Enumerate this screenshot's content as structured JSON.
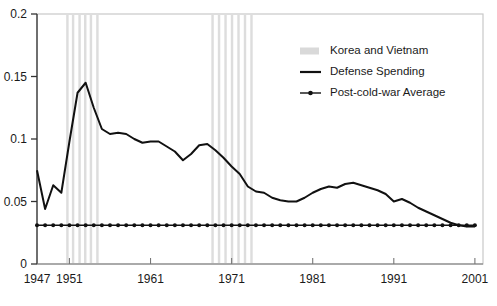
{
  "chart_data": {
    "type": "line",
    "title": "",
    "xlabel": "",
    "ylabel": "",
    "xlim": [
      1947,
      2002
    ],
    "ylim": [
      0,
      0.2
    ],
    "grid": false,
    "legend_position": "top-right",
    "xticks": [
      1947,
      1951,
      1961,
      1971,
      1981,
      1991,
      2001
    ],
    "xtick_labels": [
      "1947",
      "1951",
      "1961",
      "1971",
      "1981",
      "1991",
      "2001"
    ],
    "yticks": [
      0,
      0.05,
      0.1,
      0.15,
      0.2
    ],
    "ytick_labels": [
      "0",
      "0.05",
      "0.1",
      "0.15",
      "0.2"
    ],
    "legend": [
      {
        "label": "Korea and Vietnam",
        "marker": "band",
        "color": "#d9d9d9"
      },
      {
        "label": "Defense Spending",
        "marker": "line",
        "color": "#111111"
      },
      {
        "label": "Post-cold-war Average",
        "marker": "line-dot",
        "color": "#111111"
      }
    ],
    "series": [
      {
        "name": "Defense Spending",
        "color": "#111111",
        "x": [
          1947,
          1948,
          1949,
          1950,
          1951,
          1952,
          1953,
          1954,
          1955,
          1956,
          1957,
          1958,
          1959,
          1960,
          1961,
          1962,
          1963,
          1964,
          1965,
          1966,
          1967,
          1968,
          1969,
          1970,
          1971,
          1972,
          1973,
          1974,
          1975,
          1976,
          1977,
          1978,
          1979,
          1980,
          1981,
          1982,
          1983,
          1984,
          1985,
          1986,
          1987,
          1988,
          1989,
          1990,
          1991,
          1992,
          1993,
          1994,
          1995,
          1996,
          1997,
          1998,
          1999,
          2000,
          2001
        ],
        "values": [
          0.075,
          0.044,
          0.063,
          0.057,
          0.098,
          0.137,
          0.145,
          0.125,
          0.108,
          0.104,
          0.105,
          0.104,
          0.1,
          0.097,
          0.098,
          0.098,
          0.094,
          0.09,
          0.083,
          0.088,
          0.095,
          0.096,
          0.091,
          0.085,
          0.078,
          0.072,
          0.062,
          0.058,
          0.057,
          0.053,
          0.051,
          0.05,
          0.05,
          0.053,
          0.057,
          0.06,
          0.062,
          0.061,
          0.064,
          0.065,
          0.063,
          0.061,
          0.059,
          0.056,
          0.05,
          0.052,
          0.049,
          0.045,
          0.042,
          0.039,
          0.036,
          0.033,
          0.031,
          0.03,
          0.03
        ]
      },
      {
        "name": "Post-cold-war Average",
        "color": "#111111",
        "marker": "dot",
        "x": [
          1947,
          1948,
          1949,
          1950,
          1951,
          1952,
          1953,
          1954,
          1955,
          1956,
          1957,
          1958,
          1959,
          1960,
          1961,
          1962,
          1963,
          1964,
          1965,
          1966,
          1967,
          1968,
          1969,
          1970,
          1971,
          1972,
          1973,
          1974,
          1975,
          1976,
          1977,
          1978,
          1979,
          1980,
          1981,
          1982,
          1983,
          1984,
          1985,
          1986,
          1987,
          1988,
          1989,
          1990,
          1991,
          1992,
          1993,
          1994,
          1995,
          1996,
          1997,
          1998,
          1999,
          2000,
          2001
        ],
        "values": [
          0.031,
          0.031,
          0.031,
          0.031,
          0.031,
          0.031,
          0.031,
          0.031,
          0.031,
          0.031,
          0.031,
          0.031,
          0.031,
          0.031,
          0.031,
          0.031,
          0.031,
          0.031,
          0.031,
          0.031,
          0.031,
          0.031,
          0.031,
          0.031,
          0.031,
          0.031,
          0.031,
          0.031,
          0.031,
          0.031,
          0.031,
          0.031,
          0.031,
          0.031,
          0.031,
          0.031,
          0.031,
          0.031,
          0.031,
          0.031,
          0.031,
          0.031,
          0.031,
          0.031,
          0.031,
          0.031,
          0.031,
          0.031,
          0.031,
          0.031,
          0.031,
          0.031,
          0.031,
          0.031,
          0.031
        ]
      }
    ],
    "bands": {
      "name": "Korea and Vietnam",
      "color": "#dddddd",
      "stripes": [
        {
          "start": 1950.6,
          "end": 1950.9
        },
        {
          "start": 1951.3,
          "end": 1951.6
        },
        {
          "start": 1952.1,
          "end": 1952.4
        },
        {
          "start": 1952.8,
          "end": 1953.1
        },
        {
          "start": 1953.5,
          "end": 1953.8
        },
        {
          "start": 1954.3,
          "end": 1954.6
        },
        {
          "start": 1968.5,
          "end": 1968.8
        },
        {
          "start": 1969.3,
          "end": 1969.6
        },
        {
          "start": 1970.1,
          "end": 1970.4
        },
        {
          "start": 1970.9,
          "end": 1971.2
        },
        {
          "start": 1971.7,
          "end": 1972.0
        },
        {
          "start": 1972.5,
          "end": 1972.8
        },
        {
          "start": 1973.3,
          "end": 1973.6
        }
      ]
    }
  }
}
